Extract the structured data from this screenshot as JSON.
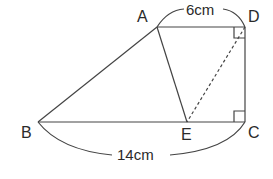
{
  "figure": {
    "type": "trapezoid-geometry",
    "points": {
      "A": {
        "label": "A",
        "x": 157,
        "y": 27
      },
      "D": {
        "label": "D",
        "x": 245,
        "y": 27
      },
      "B": {
        "label": "B",
        "x": 38,
        "y": 122
      },
      "E": {
        "label": "E",
        "x": 187,
        "y": 122
      },
      "C": {
        "label": "C",
        "x": 245,
        "y": 122
      }
    },
    "segments": [
      {
        "from": "A",
        "to": "D",
        "style": "solid"
      },
      {
        "from": "D",
        "to": "C",
        "style": "solid"
      },
      {
        "from": "B",
        "to": "C",
        "style": "solid"
      },
      {
        "from": "A",
        "to": "B",
        "style": "solid"
      },
      {
        "from": "A",
        "to": "E",
        "style": "solid"
      },
      {
        "from": "D",
        "to": "E",
        "style": "dashed"
      }
    ],
    "right_angles": [
      "D",
      "C"
    ],
    "measurements": {
      "AD": "6cm",
      "BC": "14cm"
    },
    "colors": {
      "line": "#444444",
      "text": "#2a2a2a",
      "background": "#ffffff"
    }
  }
}
